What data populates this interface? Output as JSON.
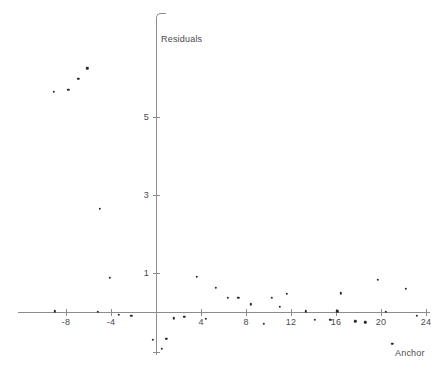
{
  "chart_data": {
    "type": "scatter",
    "title": "",
    "xlabel": "Anchor",
    "ylabel": "Residuals",
    "xlim": [
      -10.5,
      25.5
    ],
    "ylim": [
      -1.2,
      6.6
    ],
    "grid": false,
    "legend": null,
    "x_ticks": [
      -8,
      -4,
      4,
      8,
      12,
      16,
      20,
      24
    ],
    "x_tick_labels": [
      "-8",
      "-4",
      "4",
      "8",
      "12",
      "16",
      "20",
      "24"
    ],
    "y_ticks": [
      1,
      3,
      5
    ],
    "y_tick_labels": [
      "1",
      "3",
      "5"
    ],
    "series": [
      {
        "name": "residuals",
        "marker": "dot",
        "color": "#2a2a2a",
        "points": [
          {
            "x": -9.1,
            "y": 5.65
          },
          {
            "x": -7.8,
            "y": 5.7
          },
          {
            "x": -6.9,
            "y": 5.98
          },
          {
            "x": -6.1,
            "y": 6.25
          },
          {
            "x": -5.0,
            "y": 2.65
          },
          {
            "x": -4.1,
            "y": 0.88
          },
          {
            "x": -9.0,
            "y": 0.02
          },
          {
            "x": -5.2,
            "y": 0.0
          },
          {
            "x": -3.3,
            "y": -0.07
          },
          {
            "x": -2.2,
            "y": -0.1
          },
          {
            "x": -0.3,
            "y": -0.72
          },
          {
            "x": 0.9,
            "y": -0.68
          },
          {
            "x": 0.5,
            "y": -0.95
          },
          {
            "x": 1.6,
            "y": -0.16
          },
          {
            "x": 2.5,
            "y": -0.13
          },
          {
            "x": 3.6,
            "y": 0.9
          },
          {
            "x": 4.4,
            "y": -0.17
          },
          {
            "x": 5.3,
            "y": 0.62
          },
          {
            "x": 6.4,
            "y": 0.36
          },
          {
            "x": 7.3,
            "y": 0.36
          },
          {
            "x": 8.4,
            "y": 0.2
          },
          {
            "x": 9.6,
            "y": -0.3
          },
          {
            "x": 10.3,
            "y": 0.36
          },
          {
            "x": 11.0,
            "y": 0.14
          },
          {
            "x": 11.6,
            "y": 0.46
          },
          {
            "x": 13.3,
            "y": 0.02
          },
          {
            "x": 14.1,
            "y": -0.2
          },
          {
            "x": 15.5,
            "y": -0.2
          },
          {
            "x": 16.1,
            "y": 0.02
          },
          {
            "x": 16.4,
            "y": 0.48
          },
          {
            "x": 17.7,
            "y": -0.24
          },
          {
            "x": 18.6,
            "y": -0.26
          },
          {
            "x": 19.7,
            "y": 0.82
          },
          {
            "x": 20.4,
            "y": 0.0
          },
          {
            "x": 22.2,
            "y": 0.6
          },
          {
            "x": 23.2,
            "y": -0.1
          },
          {
            "x": 21.0,
            "y": -0.82
          }
        ]
      }
    ]
  },
  "axes": {
    "y_title": "Residuals",
    "x_title": "Anchor"
  }
}
